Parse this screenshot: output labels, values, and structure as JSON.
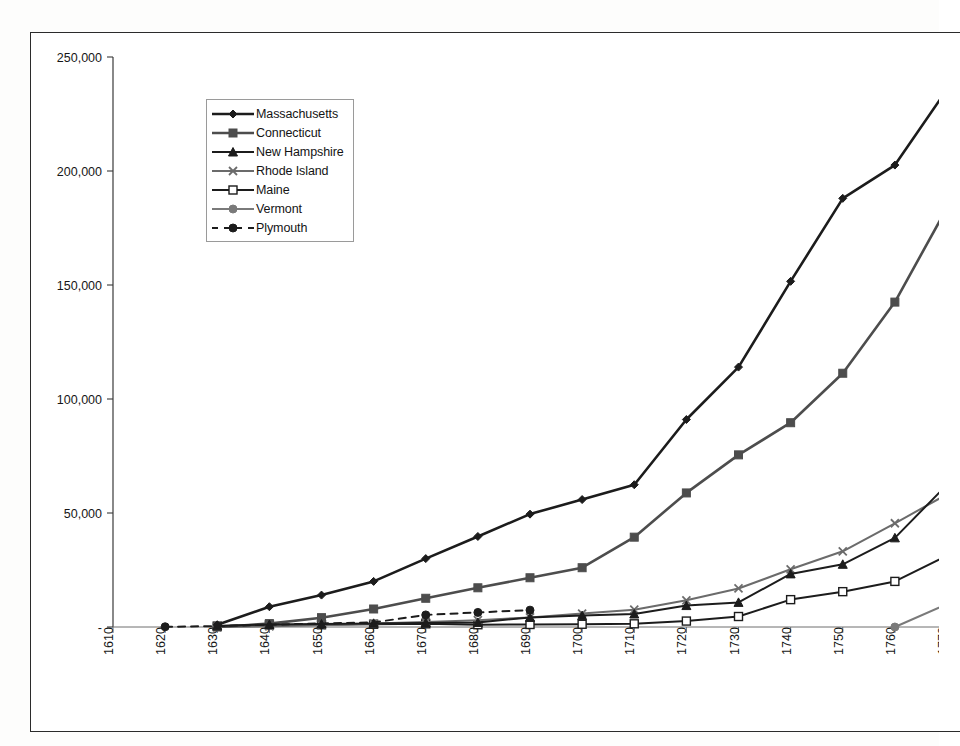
{
  "figure": {
    "background_color": "#fdfdfc",
    "frame_color": "#2b2b2b",
    "axis_color": "#3a3a3a"
  },
  "legend": {
    "position": "top-left-inside",
    "entries": [
      {
        "label": "Massachusetts",
        "marker": "diamond",
        "color": "#1c1c1c",
        "style": "solid"
      },
      {
        "label": "Connecticut",
        "marker": "square",
        "color": "#4d4d4d",
        "style": "solid"
      },
      {
        "label": "New Hampshire",
        "marker": "triangle",
        "color": "#1c1c1c",
        "style": "solid"
      },
      {
        "label": "Rhode Island",
        "marker": "x",
        "color": "#6b6b6b",
        "style": "solid"
      },
      {
        "label": "Maine",
        "marker": "open-square",
        "color": "#1c1c1c",
        "style": "solid"
      },
      {
        "label": "Vermont",
        "marker": "circle",
        "color": "#7a7a7a",
        "style": "solid"
      },
      {
        "label": "Plymouth",
        "marker": "circle",
        "color": "#1c1c1c",
        "style": "dashed"
      }
    ]
  },
  "chart_data": {
    "type": "line",
    "title": "",
    "subtitle": "",
    "xlabel": "",
    "ylabel": "",
    "grid": false,
    "legend_position": "upper left",
    "x": [
      1610,
      1620,
      1630,
      1640,
      1650,
      1660,
      1670,
      1680,
      1690,
      1700,
      1710,
      1720,
      1730,
      1740,
      1750,
      1760,
      1770
    ],
    "xlim": [
      1610,
      1770
    ],
    "ylim": [
      0,
      250000
    ],
    "ytick_values": [
      0,
      50000,
      100000,
      150000,
      200000,
      250000
    ],
    "ytick_labels": [
      "-",
      "50,000",
      "100,000",
      "150,000",
      "200,000",
      "250,000"
    ],
    "xtick_labels": [
      "1610",
      "1620",
      "1630",
      "1640",
      "1650",
      "1660",
      "1670",
      "1680",
      "1690",
      "1700",
      "1710",
      "1720",
      "1730",
      "1740",
      "1750",
      "1760",
      "1770"
    ],
    "series": [
      {
        "name": "Massachusetts",
        "marker": "diamond",
        "color": "#1c1c1c",
        "style": "solid",
        "values": [
          null,
          null,
          1000,
          8900,
          14000,
          20000,
          30000,
          39700,
          49500,
          55900,
          62400,
          91000,
          114000,
          151600,
          188000,
          202600,
          235800
        ]
      },
      {
        "name": "Connecticut",
        "marker": "square",
        "color": "#4d4d4d",
        "style": "solid",
        "values": [
          null,
          null,
          0,
          1500,
          4100,
          7900,
          12600,
          17200,
          21600,
          26000,
          39400,
          58800,
          75500,
          89600,
          111300,
          142500,
          183900
        ]
      },
      {
        "name": "New Hampshire",
        "marker": "triangle",
        "color": "#1c1c1c",
        "style": "solid",
        "values": [
          null,
          null,
          500,
          1100,
          1300,
          1600,
          1800,
          2000,
          4200,
          5000,
          5700,
          9400,
          10800,
          23300,
          27500,
          39100,
          62400
        ]
      },
      {
        "name": "Rhode Island",
        "marker": "x",
        "color": "#6b6b6b",
        "style": "solid",
        "values": [
          null,
          null,
          0,
          300,
          800,
          1500,
          2200,
          3000,
          4200,
          5900,
          7600,
          11700,
          16900,
          25300,
          33200,
          45500,
          58200
        ]
      },
      {
        "name": "Maine",
        "marker": "open-square",
        "color": "#1c1c1c",
        "style": "solid",
        "values": [
          null,
          null,
          400,
          900,
          1000,
          1200,
          1400,
          1000,
          1100,
          1200,
          1400,
          2600,
          4600,
          12000,
          15500,
          20000,
          31300
        ]
      },
      {
        "name": "Vermont",
        "marker": "circle",
        "color": "#7a7a7a",
        "style": "solid",
        "values": [
          null,
          null,
          null,
          null,
          null,
          null,
          null,
          null,
          null,
          null,
          null,
          null,
          null,
          null,
          null,
          0,
          10000
        ]
      },
      {
        "name": "Plymouth",
        "marker": "circle",
        "color": "#1c1c1c",
        "style": "dashed",
        "values": [
          null,
          100,
          400,
          1000,
          1600,
          2000,
          5300,
          6400,
          7400,
          null,
          null,
          null,
          null,
          null,
          null,
          null,
          null
        ]
      }
    ]
  }
}
